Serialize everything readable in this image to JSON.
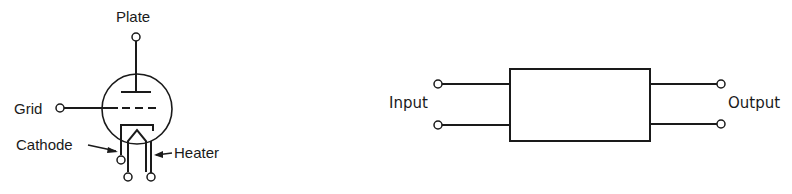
{
  "tube_diagram": {
    "labels": {
      "plate": "Plate",
      "grid": "Grid",
      "cathode": "Cathode",
      "heater": "Heater"
    }
  },
  "block_diagram": {
    "labels": {
      "input": "Input",
      "output": "Output"
    }
  },
  "colors": {
    "line": "#1a1a1a",
    "background": "#ffffff"
  }
}
